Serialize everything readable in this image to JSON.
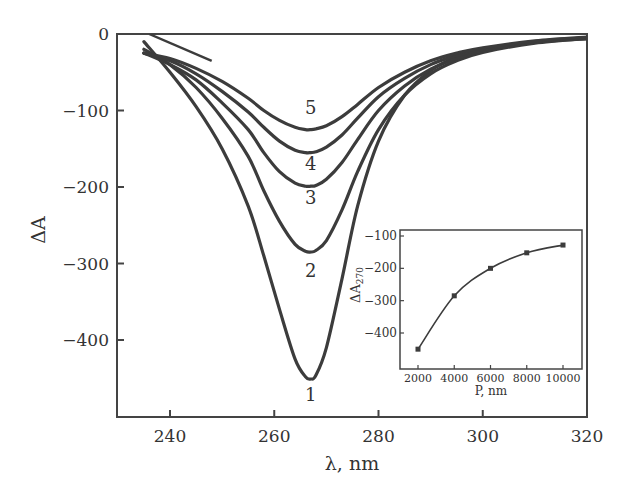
{
  "chart_data": [
    {
      "id": "main",
      "type": "line",
      "title": "",
      "xlabel": "λ, nm",
      "ylabel": "ΔA",
      "xlim": [
        230,
        320
      ],
      "ylim": [
        -500,
        0
      ],
      "xticks": [
        240,
        260,
        280,
        300,
        320
      ],
      "yticks": [
        0,
        -100,
        -200,
        -300,
        -400
      ],
      "grid": false,
      "legend": "curve numbers labeled inline below each minimum",
      "series": [
        {
          "name": "1",
          "label": "1",
          "min_x": 267,
          "min_y": -451,
          "x": [
            235,
            240,
            245,
            250,
            255,
            258,
            261,
            264,
            266,
            267,
            268,
            270,
            273,
            276,
            280,
            285,
            290,
            295,
            300,
            310,
            320
          ],
          "y": [
            -10,
            -50,
            -95,
            -150,
            -225,
            -290,
            -360,
            -425,
            -448,
            -451,
            -446,
            -410,
            -320,
            -225,
            -140,
            -80,
            -48,
            -30,
            -20,
            -10,
            -5
          ]
        },
        {
          "name": "2",
          "label": "2",
          "min_x": 267,
          "min_y": -285,
          "x": [
            235,
            240,
            245,
            250,
            255,
            258,
            261,
            264,
            266,
            267,
            268,
            270,
            273,
            276,
            280,
            285,
            290,
            295,
            300,
            310,
            320
          ],
          "y": [
            -20,
            -40,
            -70,
            -110,
            -160,
            -205,
            -245,
            -275,
            -284,
            -285,
            -283,
            -270,
            -230,
            -180,
            -125,
            -80,
            -52,
            -35,
            -24,
            -12,
            -6
          ]
        },
        {
          "name": "3",
          "label": "3",
          "min_x": 267,
          "min_y": -199,
          "x": [
            235,
            240,
            245,
            250,
            255,
            258,
            261,
            264,
            266,
            267,
            268,
            270,
            273,
            276,
            280,
            285,
            290,
            295,
            300,
            310,
            320
          ],
          "y": [
            -25,
            -40,
            -60,
            -90,
            -125,
            -155,
            -180,
            -195,
            -199,
            -199,
            -198,
            -190,
            -168,
            -138,
            -100,
            -68,
            -46,
            -32,
            -22,
            -11,
            -6
          ]
        },
        {
          "name": "4",
          "label": "4",
          "min_x": 267,
          "min_y": -155,
          "x": [
            235,
            240,
            245,
            250,
            255,
            258,
            261,
            264,
            266,
            267,
            268,
            270,
            273,
            276,
            280,
            285,
            290,
            295,
            300,
            310,
            320
          ],
          "y": [
            -25,
            -35,
            -52,
            -75,
            -102,
            -122,
            -140,
            -152,
            -155,
            -155,
            -154,
            -148,
            -132,
            -110,
            -82,
            -58,
            -40,
            -28,
            -20,
            -10,
            -5
          ]
        },
        {
          "name": "5",
          "label": "5",
          "min_x": 267,
          "min_y": -125,
          "x": [
            235,
            240,
            245,
            250,
            255,
            258,
            261,
            264,
            266,
            267,
            268,
            270,
            273,
            276,
            280,
            285,
            290,
            295,
            300,
            310,
            320
          ],
          "y": [
            -25,
            -32,
            -45,
            -62,
            -84,
            -100,
            -113,
            -122,
            -125,
            -125,
            -124,
            -120,
            -108,
            -92,
            -70,
            -50,
            -35,
            -25,
            -18,
            -9,
            -4
          ]
        }
      ],
      "annotations": [
        {
          "text": "1",
          "x": 267,
          "y": -480
        },
        {
          "text": "2",
          "x": 267,
          "y": -318
        },
        {
          "text": "3",
          "x": 267,
          "y": -222
        },
        {
          "text": "4",
          "x": 267,
          "y": -178
        },
        {
          "text": "5",
          "x": 267,
          "y": -105
        }
      ]
    },
    {
      "id": "inset",
      "type": "line",
      "title": "",
      "xlabel": "P, nm",
      "ylabel": "ΔA270",
      "ylabel_main": "ΔA",
      "ylabel_sub": "270",
      "xlim": [
        1000,
        11000
      ],
      "ylim": [
        -500,
        -80
      ],
      "xticks": [
        2000,
        4000,
        6000,
        8000,
        10000
      ],
      "yticks": [
        -100,
        -200,
        -300,
        -400
      ],
      "grid": false,
      "markers": "square",
      "series": [
        {
          "name": "ΔA270 vs P",
          "x": [
            2000,
            4000,
            6000,
            8000,
            10000
          ],
          "y": [
            -450,
            -285,
            -200,
            -152,
            -128
          ]
        }
      ]
    }
  ],
  "labels": {
    "main_xlabel": "λ, nm",
    "main_ylabel": "ΔA",
    "inset_xlabel": "P, nm",
    "inset_ylabel_main": "ΔA",
    "inset_ylabel_sub": "270"
  },
  "colors": {
    "line": "#3c3c3c",
    "axis": "#444444",
    "text": "#333333",
    "background": "#ffffff"
  }
}
